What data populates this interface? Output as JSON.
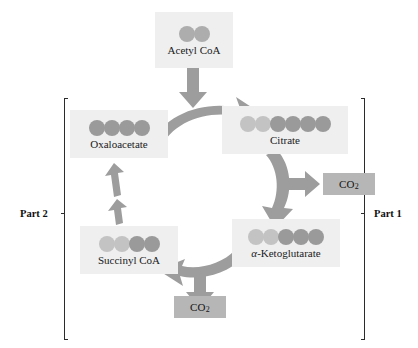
{
  "diagram": {
    "background_color": "#ffffff",
    "arrow_color": "#9d9d9d",
    "box_fill_color": "#efeff0",
    "co2_fill_color": "#b6b6b6",
    "carbon_dark_color": "#9a9a9a",
    "carbon_light_color": "#c3c3c3"
  },
  "metabolites": [
    {
      "id": "acetyl-coa",
      "label": "Acetyl CoA",
      "carbon_count": 2,
      "carbons": [
        "mid",
        "mid"
      ]
    },
    {
      "id": "oxaloacetate",
      "label": "Oxaloacetate",
      "carbon_count": 4,
      "carbons": [
        "dark",
        "dark",
        "dark",
        "dark"
      ]
    },
    {
      "id": "citrate",
      "label": "Citrate",
      "carbon_count": 6,
      "carbons": [
        "light",
        "light",
        "dark",
        "dark",
        "dark",
        "dark"
      ]
    },
    {
      "id": "alpha-ketoglutarate",
      "label_prefix": "α",
      "label_suffix": "-Ketoglutarate",
      "label": "α-Ketoglutarate",
      "carbon_count": 5,
      "carbons": [
        "light",
        "light",
        "dark",
        "dark",
        "dark"
      ]
    },
    {
      "id": "succinyl-coa",
      "label": "Succinyl CoA",
      "carbon_count": 4,
      "carbons": [
        "light",
        "light",
        "dark",
        "dark"
      ]
    }
  ],
  "products": [
    {
      "id": "co2-upper",
      "label": "CO",
      "subscript": "2"
    },
    {
      "id": "co2-lower",
      "label": "CO",
      "subscript": "2"
    }
  ],
  "sections": [
    {
      "id": "part-2",
      "label": "Part 2",
      "side": "left"
    },
    {
      "id": "part-1",
      "label": "Part 1",
      "side": "right"
    }
  ],
  "arrows": [
    {
      "id": "acetyl-to-cycle",
      "from": "acetyl-coa",
      "to": "citrate-junction",
      "shape": "straight-down"
    },
    {
      "id": "oxaloacetate-to-citrate",
      "from": "oxaloacetate",
      "to": "citrate",
      "shape": "curved-right"
    },
    {
      "id": "citrate-to-ketoglutarate",
      "from": "citrate",
      "to": "alpha-ketoglutarate",
      "shape": "curved-down",
      "branch_to": "co2-upper"
    },
    {
      "id": "ketoglutarate-to-succinyl",
      "from": "alpha-ketoglutarate",
      "to": "succinyl-coa",
      "shape": "curved-left",
      "branch_to": "co2-lower"
    },
    {
      "id": "succinyl-to-oxaloacetate",
      "from": "succinyl-coa",
      "to": "oxaloacetate",
      "shape": "multi-step-up",
      "step_count": 3
    }
  ]
}
